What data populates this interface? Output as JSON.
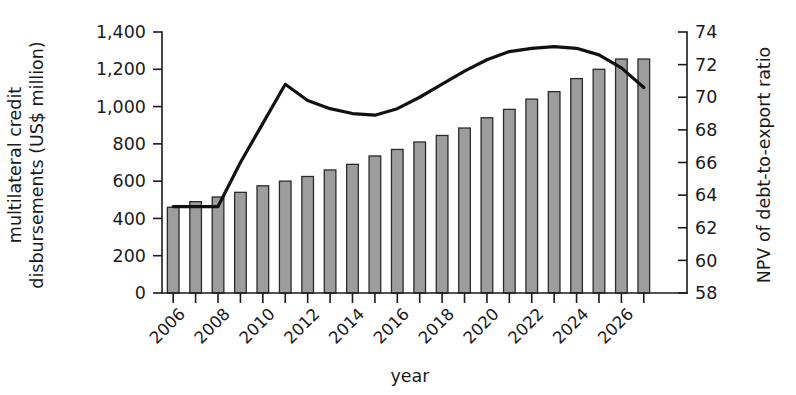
{
  "chart_data": {
    "type": "bar",
    "title": "",
    "subtitle": "",
    "xlabel": "year",
    "ylabel": "multilateral credit disbursements (US$ million)",
    "y2label": "NPV of debt-to-export ratio",
    "grid": false,
    "legend": "none",
    "xlim": [
      2005.5,
      2027.5
    ],
    "ylim": [
      0,
      1400
    ],
    "y2lim": [
      58,
      74
    ],
    "ytick_labels": [
      "0",
      "200",
      "400",
      "600",
      "800",
      "1,000",
      "1,200",
      "1,400"
    ],
    "ytick_values": [
      0,
      200,
      400,
      600,
      800,
      1000,
      1200,
      1400
    ],
    "y2tick_labels": [
      "58",
      "60",
      "62",
      "64",
      "66",
      "68",
      "70",
      "72",
      "74"
    ],
    "y2tick_values": [
      58,
      60,
      62,
      64,
      66,
      68,
      70,
      72,
      74
    ],
    "categories": [
      2006,
      2007,
      2008,
      2009,
      2010,
      2011,
      2012,
      2013,
      2014,
      2015,
      2016,
      2017,
      2018,
      2019,
      2020,
      2021,
      2022,
      2023,
      2024,
      2025,
      2026,
      2027
    ],
    "xtick_labels": [
      "2006",
      "2008",
      "2010",
      "2012",
      "2014",
      "2016",
      "2018",
      "2020",
      "2022",
      "2024",
      "2026"
    ],
    "xtick_label_values": [
      2006,
      2008,
      2010,
      2012,
      2014,
      2016,
      2018,
      2020,
      2022,
      2024,
      2026
    ],
    "series": [
      {
        "name": "multilateral credit disbursements",
        "type": "bar",
        "axis": "left",
        "unit": "US$ million",
        "fill": "#9d9d9d",
        "stroke": "#2b2b2b",
        "values": [
          460,
          490,
          515,
          540,
          575,
          600,
          625,
          660,
          690,
          735,
          770,
          810,
          845,
          885,
          940,
          985,
          1040,
          1080,
          1150,
          1200,
          1255,
          1255
        ]
      },
      {
        "name": "NPV of debt-to-export ratio",
        "type": "line",
        "axis": "right",
        "unit": "ratio",
        "stroke": "#111111",
        "values": [
          63.3,
          63.3,
          63.3,
          66.0,
          68.4,
          70.8,
          69.8,
          69.3,
          69.0,
          68.9,
          69.3,
          70.0,
          70.8,
          71.6,
          72.3,
          72.8,
          73.0,
          73.1,
          73.0,
          72.6,
          71.8,
          70.6
        ]
      }
    ]
  },
  "axis_titles": {
    "y_left": "multilateral credit disbursements (US$ million)",
    "y_right": "NPV of debt-to-export ratio",
    "x": "year"
  }
}
